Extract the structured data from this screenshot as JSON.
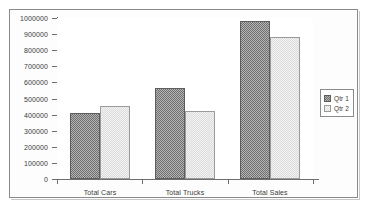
{
  "chart_data": {
    "type": "bar",
    "title": "",
    "subtitle": "",
    "xlabel": "",
    "ylabel": "",
    "categories": [
      "Total Cars",
      "Total Trucks",
      "Total Sales"
    ],
    "series": [
      {
        "name": "Qtr 1",
        "values": [
          410000,
          565000,
          980000
        ]
      },
      {
        "name": "Qtr 2",
        "values": [
          455000,
          425000,
          885000
        ]
      }
    ],
    "ylim": [
      0,
      1000000
    ],
    "ytick_step": 100000,
    "ytick_labels": [
      "1000000",
      "900000",
      "800000",
      "700000",
      "600000",
      "500000",
      "400000",
      "300000",
      "200000",
      "100000",
      "0"
    ],
    "grid": false,
    "legend_position": "right",
    "legend_entries": [
      "Qtr 1",
      "Qtr 2"
    ]
  },
  "colors": {
    "series_1_fill": "#b4b4b4",
    "series_1_border": "#5d5d5d",
    "series_2_fill": "#f2f2f2",
    "series_2_border": "#9a9a9a",
    "axis": "#6e6e6e",
    "frame_border": "#8a8a8a",
    "plot_background": "#ffffff",
    "text": "#3b3b3b"
  }
}
